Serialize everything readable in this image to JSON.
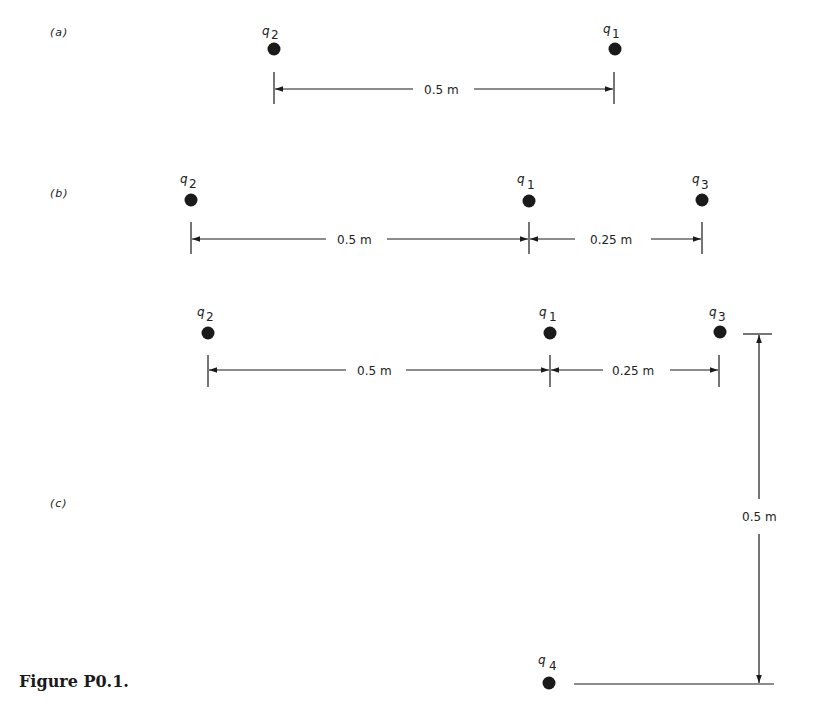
{
  "figure": {
    "caption": "Figure P0.1.",
    "panels": [
      {
        "id": "a",
        "label": "(a)",
        "charges": [
          {
            "name": "q",
            "sub": "2"
          },
          {
            "name": "q",
            "sub": "1"
          }
        ],
        "dimensions": [
          {
            "label": "0.5 m",
            "between": [
              "q2",
              "q1"
            ]
          }
        ]
      },
      {
        "id": "b",
        "label": "(b)",
        "charges": [
          {
            "name": "q",
            "sub": "2"
          },
          {
            "name": "q",
            "sub": "1"
          },
          {
            "name": "q",
            "sub": "3"
          }
        ],
        "dimensions": [
          {
            "label": "0.5 m",
            "between": [
              "q2",
              "q1"
            ]
          },
          {
            "label": "0.25 m",
            "between": [
              "q1",
              "q3"
            ]
          }
        ]
      },
      {
        "id": "c",
        "label": "(c)",
        "charges": [
          {
            "name": "q",
            "sub": "2"
          },
          {
            "name": "q",
            "sub": "1"
          },
          {
            "name": "q",
            "sub": "3"
          },
          {
            "name": "q",
            "sub": "4"
          }
        ],
        "dimensions": [
          {
            "label": "0.5 m",
            "between": [
              "q2",
              "q1"
            ]
          },
          {
            "label": "0.25 m",
            "between": [
              "q1",
              "q3"
            ]
          },
          {
            "label": "0.5 m",
            "between": [
              "q3",
              "q4"
            ],
            "orientation": "vertical"
          }
        ]
      }
    ]
  },
  "colors": {
    "ink": "#1a1a1a",
    "background": "#ffffff"
  }
}
